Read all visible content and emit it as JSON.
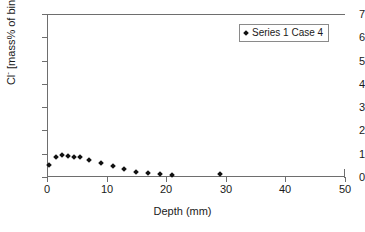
{
  "chart_data": {
    "type": "scatter",
    "title": "",
    "xlabel": "Depth (mm)",
    "ylabel": "Cl- [mass% of binder]",
    "ylabel_prefix": "Cl",
    "ylabel_superscript": "-",
    "ylabel_suffix": " [mass% of binder]",
    "xlim": [
      0,
      50
    ],
    "ylim": [
      0,
      7
    ],
    "xticks": [
      0,
      10,
      20,
      30,
      40,
      50
    ],
    "yticks": [
      0,
      1,
      2,
      3,
      4,
      5,
      6,
      7
    ],
    "xtick_labels": [
      "0",
      "10",
      "20",
      "30",
      "40",
      "50"
    ],
    "ytick_labels": [
      "0",
      "1",
      "2",
      "3",
      "4",
      "5",
      "6",
      "7"
    ],
    "grid": false,
    "legend_position": "top-right",
    "marker": "diamond",
    "marker_color": "#111111",
    "axis_color": "#6e6e6e",
    "background": "#ffffff",
    "series": [
      {
        "name": "Series 1 Case 4",
        "x": [
          0.3,
          1.5,
          2.5,
          3.5,
          4.5,
          5.5,
          7.0,
          9.0,
          11.0,
          13.0,
          15.0,
          17.0,
          19.0,
          21.0,
          29.0
        ],
        "values": [
          0.5,
          0.88,
          0.93,
          0.9,
          0.88,
          0.87,
          0.74,
          0.62,
          0.48,
          0.33,
          0.23,
          0.16,
          0.13,
          0.1,
          0.13
        ]
      }
    ]
  },
  "legend": {
    "entries": [
      {
        "label": "Series 1 Case 4",
        "marker": "diamond-marker"
      }
    ]
  }
}
